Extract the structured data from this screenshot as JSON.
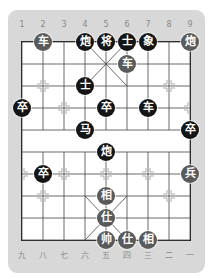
{
  "board": {
    "top_file_labels": [
      "1",
      "2",
      "3",
      "4",
      "5",
      "6",
      "7",
      "8",
      "9"
    ],
    "bottom_file_labels": [
      "九",
      "八",
      "七",
      "六",
      "五",
      "四",
      "三",
      "二",
      "一"
    ],
    "colors": {
      "panel": "#d8d8d8",
      "board": "#ffffff",
      "line": "#222222",
      "black_piece": "#151515",
      "red_piece": "#5a5a5a"
    },
    "grid": {
      "origin_x": 22,
      "origin_y": 42,
      "col_step": 21,
      "row_step": 22,
      "cols": 9,
      "rows": 10
    }
  },
  "pieces": [
    {
      "char": "车",
      "side": "red",
      "col": 1,
      "row": 0
    },
    {
      "char": "炮",
      "side": "black",
      "col": 3,
      "row": 0
    },
    {
      "char": "将",
      "side": "black",
      "col": 4,
      "row": 0
    },
    {
      "char": "士",
      "side": "black",
      "col": 5,
      "row": 0
    },
    {
      "char": "象",
      "side": "black",
      "col": 6,
      "row": 0
    },
    {
      "char": "炮",
      "side": "red",
      "col": 8,
      "row": 0
    },
    {
      "char": "车",
      "side": "red",
      "col": 5,
      "row": 1
    },
    {
      "char": "士",
      "side": "black",
      "col": 3,
      "row": 2
    },
    {
      "char": "卒",
      "side": "black",
      "col": 0,
      "row": 3
    },
    {
      "char": "卒",
      "side": "black",
      "col": 4,
      "row": 3
    },
    {
      "char": "车",
      "side": "black",
      "col": 6,
      "row": 3
    },
    {
      "char": "马",
      "side": "black",
      "col": 3,
      "row": 4
    },
    {
      "char": "卒",
      "side": "black",
      "col": 8,
      "row": 4
    },
    {
      "char": "炮",
      "side": "black",
      "col": 4,
      "row": 5
    },
    {
      "char": "卒",
      "side": "black",
      "col": 1,
      "row": 6
    },
    {
      "char": "兵",
      "side": "red",
      "col": 8,
      "row": 6
    },
    {
      "char": "相",
      "side": "red",
      "col": 4,
      "row": 7
    },
    {
      "char": "仕",
      "side": "red",
      "col": 4,
      "row": 8
    },
    {
      "char": "帅",
      "side": "red",
      "col": 4,
      "row": 9
    },
    {
      "char": "仕",
      "side": "red",
      "col": 5,
      "row": 9
    },
    {
      "char": "相",
      "side": "red",
      "col": 6,
      "row": 9
    }
  ]
}
